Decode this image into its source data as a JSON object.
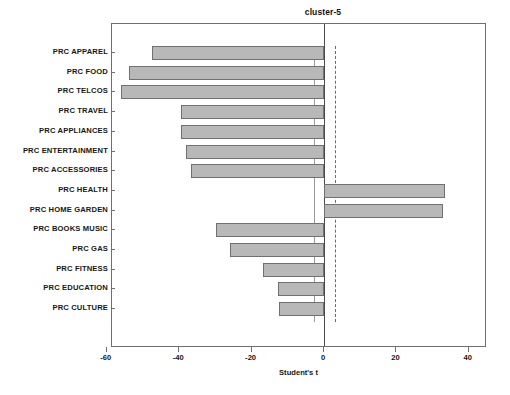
{
  "chart_data": {
    "type": "bar",
    "orientation": "horizontal",
    "title": "cluster-5",
    "xlabel": "Student's t",
    "ylabel": "",
    "xlim": [
      -64,
      45
    ],
    "xticks": [
      -60,
      -40,
      -20,
      0,
      20,
      40
    ],
    "xticklabels": [
      "-60",
      "-40",
      "-20",
      "0",
      "20",
      "40"
    ],
    "grid": false,
    "legend": null,
    "reference_lines": [
      {
        "name": "lower-threshold",
        "value": -2.8,
        "style": "solid"
      },
      {
        "name": "zero-axis",
        "value": 0,
        "style": "solid"
      },
      {
        "name": "upper-threshold",
        "value": 3.0,
        "style": "dashed"
      }
    ],
    "categories": [
      "PRC APPAREL",
      "PRC FOOD",
      "PRC TELCOS",
      "PRC TRAVEL",
      "PRC APPLIANCES",
      "PRC ENTERTAINMENT",
      "PRC ACCESSORIES",
      "PRC HEALTH",
      "PRC HOME GARDEN",
      "PRC BOOKS MUSIC",
      "PRC GAS",
      "PRC FITNESS",
      "PRC EDUCATION",
      "PRC CULTURE"
    ],
    "values": [
      -47.5,
      -54.0,
      -56.0,
      -39.5,
      -39.5,
      -38.0,
      -36.7,
      33.5,
      33.0,
      -29.8,
      -26.0,
      -16.8,
      -12.7,
      -12.4
    ],
    "bar_color": "#b8b8b8",
    "bar_edge_color": "#707070"
  },
  "figure": {
    "frame_color": "#6f6f6f",
    "background": "#ffffff"
  }
}
